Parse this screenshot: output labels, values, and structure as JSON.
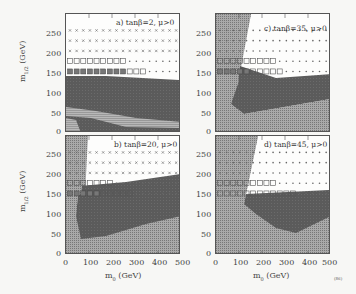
{
  "chart_data": [
    {
      "type": "heatmap",
      "panel": "a",
      "title": "a) tanβ=2, μ>0",
      "xlabel": "m0 (GeV)",
      "ylabel": "m1/2 (GeV)",
      "xlim": [
        0,
        500
      ],
      "ylim": [
        0,
        290
      ],
      "xticks": [
        0,
        100,
        200,
        300,
        400,
        500
      ],
      "yticks": [
        0,
        50,
        100,
        150,
        200,
        250
      ],
      "regions": {
        "excluded_dark": "m1/2 below ~140 GeV at m0=0 falling to ~120 GeV at m0=500",
        "hatched_band": "m1/2 ~20-60 GeV",
        "light_hatched_corner": "m0 < 60, m1/2 < 30"
      },
      "marker_rows": [
        {
          "m12": 250,
          "markers": "dots/crosses"
        },
        {
          "m12": 225,
          "markers": "crosses"
        },
        {
          "m12": 200,
          "markers": "crosses"
        },
        {
          "m12": 175,
          "open_squares_to_m0": 250,
          "rest": "dots"
        },
        {
          "m12": 150,
          "filled_squares_to_m0": 250,
          "open_squares_to_m0": 350,
          "rest": "dots"
        }
      ]
    },
    {
      "type": "heatmap",
      "panel": "b",
      "title": "b) tanβ=20, μ>0",
      "xlabel": "m0 (GeV)",
      "ylabel": "m1/2 (GeV)",
      "xlim": [
        0,
        500
      ],
      "ylim": [
        0,
        290
      ],
      "xticks": [
        0,
        100,
        200,
        300,
        400,
        500
      ],
      "yticks": [
        0,
        50,
        100,
        150,
        200,
        250
      ],
      "regions": {
        "stau_lsp_left": "m0 < ~60-80 GeV",
        "excluded_dark": "m1/2 from ~45 GeV (m0=60) up to ~130 GeV, rising toward m0=500 ~75 GeV lower edge"
      },
      "marker_rows": [
        {
          "m12": 250,
          "markers": "crosses"
        },
        {
          "m12": 225,
          "markers": "crosses"
        },
        {
          "m12": 200,
          "markers": "crosses"
        },
        {
          "m12": 175,
          "open_squares_to_m0": 200,
          "rest": "dots"
        },
        {
          "m12": 150,
          "filled_squares_to_m0": 150,
          "open_squares_to_m0": 300,
          "rest": "crosses"
        }
      ]
    },
    {
      "type": "heatmap",
      "panel": "c",
      "title": "c) tanβ=35, μ>0",
      "xlabel": "m0 (GeV)",
      "ylabel": "m1/2 (GeV)",
      "xlim": [
        0,
        500
      ],
      "ylim": [
        0,
        290
      ],
      "xticks": [
        0,
        100,
        200,
        300,
        400,
        500
      ],
      "yticks": [
        0,
        50,
        100,
        150,
        200,
        250
      ],
      "regions": {
        "stau_lsp_left": "m0 < ~100-150 GeV",
        "excluded_dark": "m1/2 ~50-140 GeV"
      },
      "marker_rows": [
        {
          "m12": 250,
          "markers": "dots"
        },
        {
          "m12": 225,
          "markers": "dots"
        },
        {
          "m12": 200,
          "markers": "dots"
        },
        {
          "m12": 175,
          "open_squares_to_m0": 250,
          "rest": "dots"
        },
        {
          "m12": 150,
          "filled_squares_to_m0": 150,
          "open_squares_to_m0": 300,
          "rest": "dots"
        }
      ]
    },
    {
      "type": "heatmap",
      "panel": "d",
      "title": "d) tanβ=45, μ>0",
      "xlabel": "m0 (GeV)",
      "ylabel": "m1/2 (GeV)",
      "xlim": [
        0,
        500
      ],
      "ylim": [
        0,
        290
      ],
      "xticks": [
        0,
        100,
        200,
        300,
        400,
        500
      ],
      "yticks": [
        0,
        50,
        100,
        150,
        200,
        250
      ],
      "regions": {
        "stau_lsp_left": "m0 < ~130-200 GeV",
        "excluded_dark": "m1/2 ~60-140 GeV, minimum ~60 at m0=350"
      },
      "marker_rows": [
        {
          "m12": 250,
          "markers": "dots"
        },
        {
          "m12": 225,
          "markers": "dots"
        },
        {
          "m12": 200,
          "markers": "dots"
        },
        {
          "m12": 175,
          "open_squares_to_m0": 250,
          "rest": "dots"
        },
        {
          "m12": 150,
          "open_squares_to_m0": 350,
          "rest": "dots"
        }
      ]
    }
  ],
  "labels": {
    "ylabel": "m",
    "ylabel_sub": "1/2",
    "ylabel_unit": "(GeV)",
    "xlabel": "m",
    "xlabel_sub": "0",
    "xlabel_unit": "(GeV)",
    "corner_mark": "(86)",
    "a": "a) tanβ=2, μ>0",
    "b": "b) tanβ=20, μ>0",
    "c": "c) tanβ=35, μ>0",
    "d": "d) tanβ=45, μ>0"
  },
  "ticks": {
    "y": [
      "0",
      "50",
      "100",
      "150",
      "200",
      "250"
    ],
    "x": [
      "0",
      "100",
      "200",
      "300",
      "400",
      "500"
    ]
  },
  "colors": {
    "dark": "#5a5a5a",
    "medium": "#8a8a8a",
    "light_hatch": "#b5b5b5",
    "frame": "#555555",
    "bg": "#fdfdfc"
  }
}
